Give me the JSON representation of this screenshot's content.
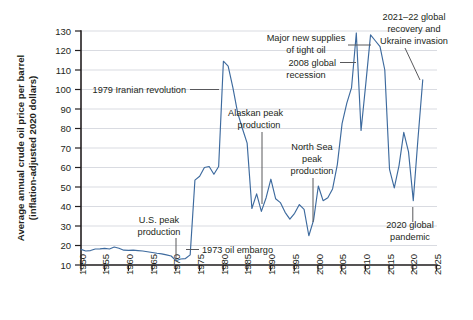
{
  "chart_data": {
    "type": "line",
    "title": "",
    "xlabel": "",
    "ylabel": "Average annual crude oil price per barrel (inflation-adjusted 2020 dollars)",
    "ylabel_line1": "Average annual crude oil price per barrel",
    "ylabel_line2": "(inflation-adjusted 2020 dollars)",
    "xlim": [
      1950,
      2025
    ],
    "ylim": [
      10,
      130
    ],
    "grid": "horizontal",
    "legend": "none",
    "line_color": "#3d6a9e",
    "grid_color": "#c9ccd4",
    "axis_color": "#231f20",
    "y_ticks": [
      10,
      20,
      30,
      40,
      50,
      60,
      70,
      80,
      90,
      100,
      110,
      120,
      130
    ],
    "x_ticks": [
      1950,
      1955,
      1960,
      1965,
      1970,
      1975,
      1980,
      1985,
      1990,
      1995,
      2000,
      2005,
      2010,
      2015,
      2020,
      2025
    ],
    "x": [
      1950,
      1951,
      1952,
      1953,
      1954,
      1955,
      1956,
      1957,
      1958,
      1959,
      1960,
      1961,
      1962,
      1963,
      1964,
      1965,
      1966,
      1967,
      1968,
      1969,
      1970,
      1971,
      1972,
      1973,
      1974,
      1975,
      1976,
      1977,
      1978,
      1979,
      1980,
      1981,
      1982,
      1983,
      1984,
      1985,
      1986,
      1987,
      1988,
      1989,
      1990,
      1991,
      1992,
      1993,
      1994,
      1995,
      1996,
      1997,
      1998,
      1999,
      2000,
      2001,
      2002,
      2003,
      2004,
      2005,
      2006,
      2007,
      2008,
      2009,
      2010,
      2011,
      2012,
      2013,
      2014,
      2015,
      2016,
      2017,
      2018,
      2019,
      2020,
      2021,
      2022
    ],
    "values": [
      18.0,
      17.2,
      17.4,
      18.2,
      18.3,
      18.5,
      18.2,
      19.2,
      18.6,
      17.6,
      17.5,
      17.6,
      17.4,
      17.2,
      16.8,
      16.4,
      16.0,
      15.7,
      15.2,
      14.6,
      12.2,
      13.1,
      13.3,
      15.2,
      53.5,
      55.5,
      60.0,
      60.5,
      56.5,
      60.5,
      114.5,
      112.0,
      101.0,
      88.0,
      80.0,
      72.5,
      39.0,
      46.5,
      37.5,
      44.5,
      54.0,
      44.0,
      42.0,
      37.0,
      33.5,
      36.5,
      41.0,
      38.5,
      25.0,
      33.0,
      50.5,
      43.0,
      44.5,
      49.0,
      61.5,
      82.5,
      93.0,
      101.0,
      129.0,
      79.0,
      103.0,
      128.0,
      125.0,
      122.0,
      110.0,
      59.0,
      49.5,
      61.0,
      78.0,
      68.0,
      43.0,
      75.0,
      105.0
    ],
    "annotations": [
      {
        "id": "iranian-revolution",
        "text": "1979 Iranian revolution",
        "point_year": 1979,
        "point_value": 60
      },
      {
        "id": "us-peak-production",
        "text_line1": "U.S. peak",
        "text_line2": "production",
        "point_year": 1970,
        "point_value": 12
      },
      {
        "id": "oil-embargo",
        "text": "1973 oil embargo",
        "point_year": 1973,
        "point_value": 16
      },
      {
        "id": "alaskan-peak-production",
        "text_line1": "Alaskan peak",
        "text_line2": "production",
        "point_year": 1988,
        "point_value": 38
      },
      {
        "id": "north-sea-peak-production",
        "text_line1": "North Sea",
        "text_line2": "peak",
        "text_line3": "production",
        "point_year": 1999,
        "point_value": 31
      },
      {
        "id": "tight-oil-supplies",
        "text_line1": "Major new supplies",
        "text_line2": "of tight oil",
        "point_year": 2011,
        "point_value": 128
      },
      {
        "id": "global-recession-2008",
        "text_line1": "2008 global",
        "text_line2": "recession",
        "point_year": 2008,
        "point_value": 118
      },
      {
        "id": "recovery-ukraine-invasion",
        "text_line1": "2021–22 global",
        "text_line2": "recovery and",
        "text_line3": "Ukraine invasion",
        "point_year": 2022,
        "point_value": 105
      },
      {
        "id": "global-pandemic-2020",
        "text_line1": "2020 global",
        "text_line2": "pandemic",
        "point_year": 2020,
        "point_value": 43
      }
    ]
  }
}
